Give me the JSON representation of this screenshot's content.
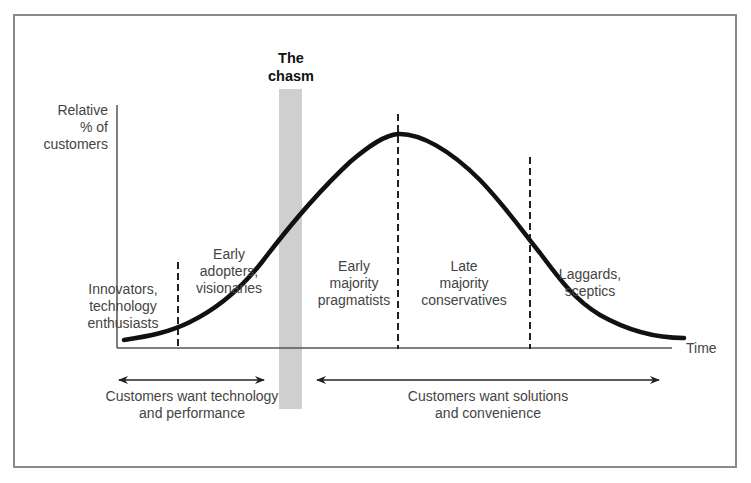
{
  "title": {
    "line1": "The",
    "line2": "chasm"
  },
  "axes": {
    "y_label": [
      "Relative",
      "% of",
      "customers"
    ],
    "x_label": "Time"
  },
  "segments": [
    {
      "id": "innovators",
      "lines": [
        "Innovators,",
        "technology",
        "enthusiasts"
      ]
    },
    {
      "id": "early-adopters",
      "lines": [
        "Early",
        "adopters,",
        "visionaries"
      ]
    },
    {
      "id": "early-majority",
      "lines": [
        "Early",
        "majority",
        "pragmatists"
      ]
    },
    {
      "id": "late-majority",
      "lines": [
        "Late",
        "majority",
        "conservatives"
      ]
    },
    {
      "id": "laggards",
      "lines": [
        "Laggards,",
        "sceptics"
      ]
    }
  ],
  "arrows": [
    {
      "id": "technology",
      "lines": [
        "Customers want technology",
        "and performance"
      ]
    },
    {
      "id": "solutions",
      "lines": [
        "Customers want solutions",
        "and convenience"
      ]
    }
  ],
  "colors": {
    "curve": "#111111",
    "chasm_bar": "#cfcfcf",
    "axis": "#555555",
    "frame": "#8a8a8a",
    "text": "#444444"
  }
}
